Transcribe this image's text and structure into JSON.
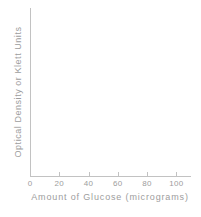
{
  "chart_data": {
    "type": "line",
    "title": "",
    "xlabel": "Amount of Glucose (micrograms)",
    "ylabel": "Optical Density or Klett Units",
    "x": [],
    "values": [],
    "series": [],
    "xticks": [
      0,
      20,
      40,
      60,
      80,
      100
    ],
    "xticklabels": [
      "0",
      "20",
      "40",
      "60",
      "80",
      "100"
    ],
    "yticks": [],
    "yticklabels": [],
    "xlim": [
      0,
      110
    ],
    "ylim": [
      0,
      100
    ],
    "grid": false,
    "legend": null,
    "annotations": [],
    "note": "empty axes, no data plotted"
  },
  "style": {
    "background": "#ffffff",
    "axis_color": "#c2c2c2",
    "text_color": "#9d9d9d"
  }
}
